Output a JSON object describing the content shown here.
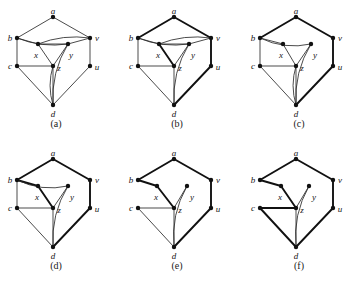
{
  "figure": {
    "background_color": "#ffffff",
    "line_color": "#2b2b2b",
    "bold_line_color": "#111111",
    "node_color": "#111111",
    "label_color": "#141414",
    "vertex_labels": {
      "a": "a",
      "b": "b",
      "c": "c",
      "d": "d",
      "u": "u",
      "v": "v",
      "x": "x",
      "y": "y",
      "z": "z"
    },
    "panels": [
      {
        "id": "a",
        "caption": "(a)",
        "origin": [
          6,
          6
        ],
        "nodes": {
          "a": {
            "x": 47,
            "y": 11,
            "label_dx": 0,
            "label_dy": -5
          },
          "b": {
            "x": 11,
            "y": 32,
            "label_dx": -7,
            "label_dy": 1
          },
          "v": {
            "x": 84,
            "y": 32,
            "label_dx": 7,
            "label_dy": 1
          },
          "x": {
            "x": 32,
            "y": 38,
            "label_dx": -2,
            "label_dy": 12
          },
          "y": {
            "x": 62,
            "y": 38,
            "label_dx": 3,
            "label_dy": 12
          },
          "c": {
            "x": 11,
            "y": 60,
            "label_dx": -7,
            "label_dy": 1
          },
          "z": {
            "x": 47,
            "y": 60,
            "label_dx": 6,
            "label_dy": 3
          },
          "u": {
            "x": 84,
            "y": 60,
            "label_dx": 7,
            "label_dy": 2
          },
          "d": {
            "x": 47,
            "y": 99,
            "label_dx": 0,
            "label_dy": 10
          }
        },
        "straight_edges": [
          [
            "a",
            "b"
          ],
          [
            "a",
            "v"
          ],
          [
            "b",
            "c"
          ],
          [
            "v",
            "u"
          ],
          [
            "b",
            "x"
          ],
          [
            "x",
            "y"
          ],
          [
            "y",
            "v"
          ],
          [
            "x",
            "z"
          ],
          [
            "y",
            "z"
          ],
          [
            "c",
            "z"
          ],
          [
            "c",
            "d"
          ],
          [
            "z",
            "d"
          ],
          [
            "u",
            "d"
          ]
        ],
        "curved_edges": [
          {
            "from": "b",
            "to": "y",
            "bow": 7,
            "name": "b-y-curve"
          },
          {
            "from": "v",
            "to": "x",
            "bow": 7,
            "name": "v-x-curve"
          },
          {
            "from": "y",
            "to": "d",
            "bow": 10,
            "name": "y-d-curve"
          },
          {
            "from": "z",
            "to": "d",
            "bow": 6,
            "name": "z-d-curve"
          }
        ],
        "bold_edges": []
      },
      {
        "id": "b",
        "caption": "(b)",
        "origin": [
          127,
          6
        ],
        "nodes": {
          "a": {
            "x": 47,
            "y": 11,
            "label_dx": 0,
            "label_dy": -5
          },
          "b": {
            "x": 11,
            "y": 32,
            "label_dx": -7,
            "label_dy": 1
          },
          "v": {
            "x": 84,
            "y": 32,
            "label_dx": 7,
            "label_dy": 1
          },
          "x": {
            "x": 32,
            "y": 38,
            "label_dx": -1,
            "label_dy": 12
          },
          "y": {
            "x": 62,
            "y": 38,
            "label_dx": 4,
            "label_dy": 12
          },
          "c": {
            "x": 11,
            "y": 60,
            "label_dx": -7,
            "label_dy": 1
          },
          "z": {
            "x": 47,
            "y": 60,
            "label_dx": 6,
            "label_dy": 3
          },
          "u": {
            "x": 84,
            "y": 60,
            "label_dx": 7,
            "label_dy": 2
          },
          "d": {
            "x": 47,
            "y": 99,
            "label_dx": 0,
            "label_dy": 10
          }
        },
        "straight_edges": [
          [
            "a",
            "b"
          ],
          [
            "a",
            "v"
          ],
          [
            "b",
            "c"
          ],
          [
            "v",
            "u"
          ],
          [
            "b",
            "x"
          ],
          [
            "x",
            "y"
          ],
          [
            "y",
            "v"
          ],
          [
            "x",
            "z"
          ],
          [
            "y",
            "z"
          ],
          [
            "c",
            "z"
          ],
          [
            "c",
            "d"
          ],
          [
            "z",
            "d"
          ],
          [
            "u",
            "d"
          ]
        ],
        "curved_edges": [
          {
            "from": "b",
            "to": "y",
            "bow": 7,
            "name": "b-y-curve"
          },
          {
            "from": "v",
            "to": "x",
            "bow": 7,
            "name": "v-x-curve"
          },
          {
            "from": "y",
            "to": "d",
            "bow": 10,
            "name": "y-d-curve"
          }
        ],
        "bold_edges": [
          [
            "a",
            "b"
          ],
          [
            "a",
            "v"
          ],
          [
            "v",
            "u"
          ],
          [
            "u",
            "d"
          ],
          [
            "x",
            "z"
          ]
        ]
      },
      {
        "id": "c",
        "caption": "(c)",
        "origin": [
          249,
          6
        ],
        "nodes": {
          "a": {
            "x": 47,
            "y": 11,
            "label_dx": 0,
            "label_dy": -5
          },
          "b": {
            "x": 11,
            "y": 32,
            "label_dx": -7,
            "label_dy": 1
          },
          "v": {
            "x": 84,
            "y": 32,
            "label_dx": 7,
            "label_dy": 1
          },
          "x": {
            "x": 34,
            "y": 38,
            "label_dx": -2,
            "label_dy": 12
          },
          "y": {
            "x": 62,
            "y": 38,
            "label_dx": 4,
            "label_dy": 12
          },
          "c": {
            "x": 11,
            "y": 60,
            "label_dx": -7,
            "label_dy": 1
          },
          "z": {
            "x": 47,
            "y": 60,
            "label_dx": 6,
            "label_dy": 3
          },
          "u": {
            "x": 84,
            "y": 60,
            "label_dx": 7,
            "label_dy": 2
          },
          "d": {
            "x": 47,
            "y": 99,
            "label_dx": 0,
            "label_dy": 10
          }
        },
        "straight_edges": [
          [
            "a",
            "b"
          ],
          [
            "a",
            "v"
          ],
          [
            "b",
            "c"
          ],
          [
            "v",
            "u"
          ],
          [
            "b",
            "x"
          ],
          [
            "x",
            "z"
          ],
          [
            "y",
            "z"
          ],
          [
            "c",
            "z"
          ],
          [
            "c",
            "d"
          ],
          [
            "z",
            "d"
          ],
          [
            "u",
            "d"
          ]
        ],
        "curved_edges": [
          {
            "from": "b",
            "to": "y",
            "bow": 9,
            "name": "b-y-curve"
          },
          {
            "from": "y",
            "to": "d",
            "bow": 10,
            "name": "y-d-curve"
          },
          {
            "from": "z",
            "to": "d",
            "bow": 6,
            "name": "z-d-curve"
          }
        ],
        "bold_edges": [
          [
            "a",
            "b"
          ],
          [
            "a",
            "v"
          ],
          [
            "v",
            "u"
          ],
          [
            "u",
            "d"
          ]
        ]
      },
      {
        "id": "d",
        "caption": "(d)",
        "origin": [
          6,
          148
        ],
        "nodes": {
          "a": {
            "x": 47,
            "y": 11,
            "label_dx": 0,
            "label_dy": -5
          },
          "b": {
            "x": 11,
            "y": 32,
            "label_dx": -7,
            "label_dy": 1
          },
          "v": {
            "x": 84,
            "y": 32,
            "label_dx": 7,
            "label_dy": 1
          },
          "x": {
            "x": 32,
            "y": 38,
            "label_dx": -1,
            "label_dy": 12
          },
          "y": {
            "x": 62,
            "y": 38,
            "label_dx": 4,
            "label_dy": 12
          },
          "c": {
            "x": 11,
            "y": 60,
            "label_dx": -7,
            "label_dy": 1
          },
          "z": {
            "x": 47,
            "y": 60,
            "label_dx": 6,
            "label_dy": 3
          },
          "u": {
            "x": 84,
            "y": 60,
            "label_dx": 7,
            "label_dy": 2
          },
          "d": {
            "x": 47,
            "y": 99,
            "label_dx": 0,
            "label_dy": 10
          }
        },
        "straight_edges": [
          [
            "a",
            "b"
          ],
          [
            "a",
            "v"
          ],
          [
            "b",
            "c"
          ],
          [
            "v",
            "u"
          ],
          [
            "b",
            "x"
          ],
          [
            "x",
            "z"
          ],
          [
            "y",
            "z"
          ],
          [
            "c",
            "z"
          ],
          [
            "c",
            "d"
          ],
          [
            "z",
            "d"
          ],
          [
            "u",
            "d"
          ]
        ],
        "curved_edges": [
          {
            "from": "b",
            "to": "y",
            "bow": 9,
            "name": "b-y-curve"
          },
          {
            "from": "y",
            "to": "d",
            "bow": 10,
            "name": "y-d-curve"
          }
        ],
        "bold_edges": [
          [
            "a",
            "b"
          ],
          [
            "a",
            "v"
          ],
          [
            "v",
            "u"
          ],
          [
            "u",
            "d"
          ],
          [
            "b",
            "x"
          ],
          [
            "x",
            "z"
          ]
        ]
      },
      {
        "id": "e",
        "caption": "(e)",
        "origin": [
          127,
          148
        ],
        "nodes": {
          "a": {
            "x": 47,
            "y": 11,
            "label_dx": 0,
            "label_dy": -5
          },
          "b": {
            "x": 11,
            "y": 32,
            "label_dx": -7,
            "label_dy": 1
          },
          "v": {
            "x": 84,
            "y": 32,
            "label_dx": 7,
            "label_dy": 1
          },
          "x": {
            "x": 30,
            "y": 38,
            "label_dx": -1,
            "label_dy": 12
          },
          "y": {
            "x": 60,
            "y": 38,
            "label_dx": 5,
            "label_dy": 12
          },
          "c": {
            "x": 11,
            "y": 60,
            "label_dx": -7,
            "label_dy": 1
          },
          "z": {
            "x": 47,
            "y": 60,
            "label_dx": 6,
            "label_dy": 3
          },
          "u": {
            "x": 84,
            "y": 60,
            "label_dx": 7,
            "label_dy": 2
          },
          "d": {
            "x": 47,
            "y": 99,
            "label_dx": 0,
            "label_dy": 10
          }
        },
        "straight_edges": [
          [
            "a",
            "b"
          ],
          [
            "a",
            "v"
          ],
          [
            "v",
            "u"
          ],
          [
            "b",
            "x"
          ],
          [
            "x",
            "z"
          ],
          [
            "y",
            "z"
          ],
          [
            "c",
            "z"
          ],
          [
            "c",
            "d"
          ],
          [
            "z",
            "d"
          ],
          [
            "u",
            "d"
          ]
        ],
        "curved_edges": [
          {
            "from": "y",
            "to": "d",
            "bow": 10,
            "name": "y-d-curve"
          }
        ],
        "bold_edges": [
          [
            "a",
            "b"
          ],
          [
            "a",
            "v"
          ],
          [
            "v",
            "u"
          ],
          [
            "u",
            "d"
          ],
          [
            "b",
            "x"
          ],
          [
            "x",
            "z"
          ]
        ]
      },
      {
        "id": "f",
        "caption": "(f)",
        "origin": [
          249,
          148
        ],
        "nodes": {
          "a": {
            "x": 47,
            "y": 11,
            "label_dx": 0,
            "label_dy": -5
          },
          "b": {
            "x": 11,
            "y": 32,
            "label_dx": -7,
            "label_dy": 1
          },
          "v": {
            "x": 84,
            "y": 32,
            "label_dx": 7,
            "label_dy": 1
          },
          "x": {
            "x": 32,
            "y": 38,
            "label_dx": -1,
            "label_dy": 12
          },
          "y": {
            "x": 60,
            "y": 38,
            "label_dx": 5,
            "label_dy": 12
          },
          "c": {
            "x": 11,
            "y": 60,
            "label_dx": -7,
            "label_dy": 1
          },
          "z": {
            "x": 47,
            "y": 60,
            "label_dx": 6,
            "label_dy": 3
          },
          "u": {
            "x": 84,
            "y": 60,
            "label_dx": 7,
            "label_dy": 2
          },
          "d": {
            "x": 47,
            "y": 99,
            "label_dx": 0,
            "label_dy": 10
          }
        },
        "straight_edges": [
          [
            "a",
            "b"
          ],
          [
            "a",
            "v"
          ],
          [
            "v",
            "u"
          ],
          [
            "b",
            "x"
          ],
          [
            "x",
            "z"
          ],
          [
            "y",
            "z"
          ],
          [
            "c",
            "z"
          ],
          [
            "c",
            "d"
          ],
          [
            "z",
            "d"
          ],
          [
            "u",
            "d"
          ]
        ],
        "curved_edges": [
          {
            "from": "y",
            "to": "d",
            "bow": 10,
            "name": "y-d-curve"
          }
        ],
        "bold_edges": [
          [
            "a",
            "b"
          ],
          [
            "a",
            "v"
          ],
          [
            "v",
            "u"
          ],
          [
            "u",
            "d"
          ],
          [
            "b",
            "x"
          ],
          [
            "x",
            "z"
          ],
          [
            "c",
            "z"
          ],
          [
            "c",
            "d"
          ]
        ]
      }
    ]
  }
}
